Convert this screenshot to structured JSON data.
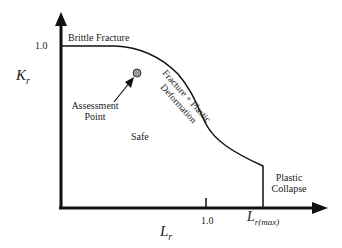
{
  "diagram": {
    "type": "failure-assessment-diagram",
    "y_axis": {
      "label": "K",
      "label_sub": "r",
      "tick": "1.0"
    },
    "x_axis": {
      "label": "L",
      "label_sub": "r",
      "ticks": [
        "1.0"
      ],
      "max_label": "L",
      "max_label_sub": "r(max)"
    },
    "regions": {
      "brittle": "Brittle Fracture",
      "mixed_line1": "Fracture + Plastic",
      "mixed_line2": "Deformation",
      "safe": "Safe",
      "collapse_line1": "Plastic",
      "collapse_line2": "Collapse"
    },
    "assessment_point": {
      "line1": "Assessment",
      "line2": "Point"
    },
    "colors": {
      "line": "#111111",
      "point_fill": "#9a9a9a"
    }
  }
}
